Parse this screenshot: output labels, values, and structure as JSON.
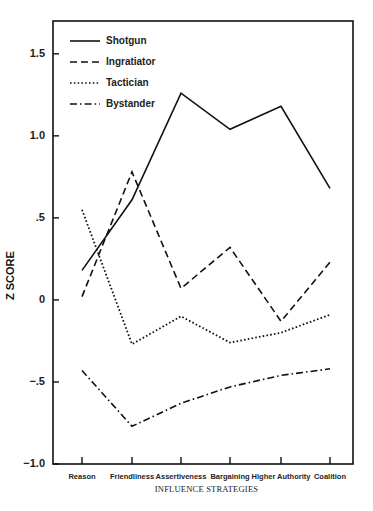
{
  "chart_data": {
    "type": "line",
    "title": "",
    "xlabel": "INFLUENCE STRATEGIES",
    "ylabel": "Z SCORE",
    "categories": [
      "Reason",
      "Friendliness",
      "Assertiveness",
      "Bargaining",
      "Higher Authority",
      "Coalition"
    ],
    "ylim": [
      -1.0,
      1.7
    ],
    "yticks": [
      1.5,
      1.0,
      0.5,
      0,
      -0.5,
      -1.0
    ],
    "ytick_labels": [
      "1.5",
      "1.0",
      ".5",
      "0",
      "−.5",
      "−1.0"
    ],
    "grid": false,
    "legend_position": "upper left",
    "series": [
      {
        "name": "Shotgun",
        "style": "solid",
        "values": [
          0.18,
          0.61,
          1.26,
          1.04,
          1.18,
          0.68
        ]
      },
      {
        "name": "Ingratiator",
        "style": "dashed",
        "values": [
          0.02,
          0.78,
          0.07,
          0.32,
          -0.13,
          0.23
        ]
      },
      {
        "name": "Tactician",
        "style": "dotted",
        "values": [
          0.55,
          -0.27,
          -0.1,
          -0.26,
          -0.2,
          -0.09
        ]
      },
      {
        "name": "Bystander",
        "style": "dash-dot",
        "values": [
          -0.43,
          -0.77,
          -0.63,
          -0.53,
          -0.46,
          -0.42
        ]
      }
    ]
  },
  "colors": {
    "line": "#111111",
    "axis": "#111111",
    "background": "#ffffff"
  }
}
